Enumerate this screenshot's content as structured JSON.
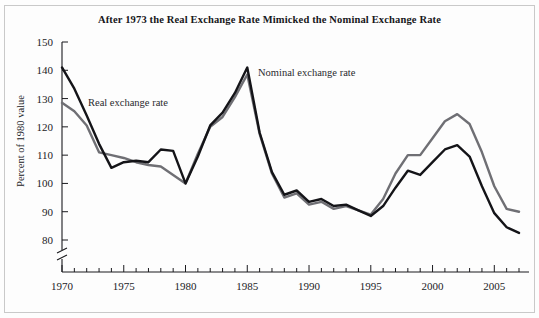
{
  "figure": {
    "title": "After 1973 the Real Exchange Rate Mimicked the Nominal Exchange Rate",
    "background_color": "#fdfdfd",
    "border_color": "#c9c9c9"
  },
  "annotations": {
    "real_label": "Real exchange rate",
    "nominal_label": "Nominal exchange rate"
  },
  "chart_data": {
    "type": "line",
    "title": "After 1973 the Real Exchange Rate Mimicked the Nominal Exchange Rate",
    "xlabel": "",
    "ylabel": "Percent of 1980 value",
    "xlim": [
      1970,
      2007
    ],
    "ylim": [
      78,
      150
    ],
    "y_axis_break": true,
    "y_break_below": 80,
    "grid": false,
    "legend": "inline-annotations",
    "x_tick_labels": [
      "1970",
      "1975",
      "1980",
      "1985",
      "1990",
      "1995",
      "2000",
      "2005"
    ],
    "x_tick_values": [
      1970,
      1975,
      1980,
      1985,
      1990,
      1995,
      2000,
      2005
    ],
    "x_minor_tick_interval": 1,
    "y_tick_labels": [
      "80",
      "90",
      "100",
      "110",
      "120",
      "130",
      "140",
      "150"
    ],
    "y_tick_values": [
      80,
      90,
      100,
      110,
      120,
      130,
      140,
      150
    ],
    "x": [
      1970,
      1971,
      1972,
      1973,
      1974,
      1975,
      1976,
      1977,
      1978,
      1979,
      1980,
      1981,
      1982,
      1983,
      1984,
      1985,
      1986,
      1987,
      1988,
      1989,
      1990,
      1991,
      1992,
      1993,
      1994,
      1995,
      1996,
      1997,
      1998,
      1999,
      2000,
      2001,
      2002,
      2003,
      2004,
      2005,
      2006,
      2007
    ],
    "series": [
      {
        "name": "Nominal exchange rate",
        "color": "#141418",
        "width": 2.4,
        "values": [
          141.0,
          133.5,
          124.0,
          114.0,
          105.5,
          107.5,
          108.0,
          107.5,
          112.0,
          111.5,
          100.0,
          109.5,
          120.5,
          125.0,
          132.0,
          141.0,
          118.0,
          104.0,
          96.0,
          97.5,
          93.5,
          94.5,
          92.0,
          92.5,
          90.5,
          88.5,
          92.0,
          98.5,
          104.5,
          103.0,
          107.5,
          112.0,
          113.5,
          109.5,
          99.0,
          89.5,
          84.5,
          82.5
        ]
      },
      {
        "name": "Real exchange rate",
        "color": "#6f6f74",
        "width": 2.4,
        "values": [
          128.5,
          125.5,
          120.5,
          111.0,
          110.0,
          109.0,
          107.5,
          106.5,
          106.0,
          103.0,
          100.0,
          110.5,
          120.0,
          123.5,
          130.5,
          138.5,
          117.5,
          103.5,
          95.0,
          96.5,
          92.5,
          93.5,
          91.0,
          92.0,
          90.5,
          89.0,
          94.5,
          103.5,
          110.0,
          110.0,
          116.0,
          122.0,
          124.5,
          121.0,
          111.0,
          99.0,
          91.0,
          90.0
        ]
      }
    ]
  }
}
